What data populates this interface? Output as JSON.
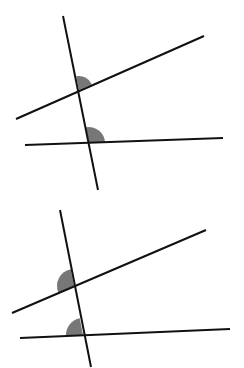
{
  "colors": {
    "background": "#ffffff",
    "line": "#111111",
    "angle_fill": "#777777"
  },
  "diagrams": [
    {
      "id": "top",
      "description": "Two non-parallel lines cut by a transversal; corresponding angles marked at upper-right of each intersection",
      "transversal": {
        "x1": 63,
        "y1": 16,
        "x2": 98,
        "y2": 190
      },
      "lines": [
        {
          "name": "upper-line",
          "x1": 16,
          "y1": 119,
          "x2": 204,
          "y2": 36
        },
        {
          "name": "lower-line",
          "x1": 25,
          "y1": 145,
          "x2": 223,
          "y2": 138
        }
      ],
      "angles": [
        {
          "name": "angle-upper",
          "cx": 79,
          "cy": 90,
          "r": 14,
          "side": "upper-right"
        },
        {
          "name": "angle-lower",
          "cx": 89,
          "cy": 143,
          "r": 16,
          "side": "upper-right"
        }
      ]
    },
    {
      "id": "bottom",
      "description": "Two non-parallel lines cut by a transversal; corresponding angles marked at upper-left of each intersection",
      "transversal": {
        "x1": 60,
        "y1": 210,
        "x2": 91,
        "y2": 367
      },
      "lines": [
        {
          "name": "upper-line",
          "x1": 12,
          "y1": 313,
          "x2": 206,
          "y2": 230
        },
        {
          "name": "lower-line",
          "x1": 20,
          "y1": 338,
          "x2": 230,
          "y2": 329
        }
      ],
      "angles": [
        {
          "name": "angle-upper",
          "cx": 74,
          "cy": 286,
          "r": 17,
          "side": "upper-left"
        },
        {
          "name": "angle-lower",
          "cx": 83,
          "cy": 335,
          "r": 17,
          "side": "upper-left"
        }
      ]
    }
  ]
}
